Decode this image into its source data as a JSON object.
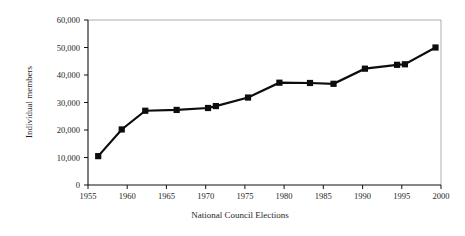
{
  "chart_data": {
    "type": "line",
    "title": "",
    "xlabel": "National Council Elections",
    "ylabel": "Individual members",
    "xlim": [
      1955,
      2000
    ],
    "ylim": [
      0,
      60000
    ],
    "grid": false,
    "legend": null,
    "marker": "square",
    "line_color": "#0d0d0d",
    "xticks": [
      "1955",
      "1960",
      "1965",
      "1970",
      "1975",
      "1980",
      "1985",
      "1990",
      "1995",
      "2000"
    ],
    "xtick_values": [
      1955,
      1960,
      1965,
      1970,
      1975,
      1980,
      1985,
      1990,
      1995,
      2000
    ],
    "yticks": [
      "0",
      "10,000",
      "20,000",
      "30,000",
      "40,000",
      "50,000",
      "60,000"
    ],
    "ytick_values": [
      0,
      10000,
      20000,
      30000,
      40000,
      50000,
      60000
    ],
    "x": [
      1956.3,
      1959.3,
      1962.3,
      1966.3,
      1970.3,
      1971.3,
      1975.4,
      1979.4,
      1983.3,
      1986.3,
      1990.3,
      1994.4,
      1995.4,
      1999.3
    ],
    "values": [
      10500,
      20200,
      27000,
      27300,
      28000,
      28700,
      31800,
      37200,
      37100,
      36800,
      42300,
      43700,
      43900,
      50000
    ],
    "series": [
      {
        "name": "Individual members",
        "x": [
          1956.3,
          1959.3,
          1962.3,
          1966.3,
          1970.3,
          1971.3,
          1975.4,
          1979.4,
          1983.3,
          1986.3,
          1990.3,
          1994.4,
          1995.4,
          1999.3
        ],
        "values": [
          10500,
          20200,
          27000,
          27300,
          28000,
          28700,
          31800,
          37200,
          37100,
          36800,
          42300,
          43700,
          43900,
          50000
        ]
      }
    ]
  },
  "figure": {
    "background": "#ffffff",
    "axis_color": "#111111",
    "frame_color": "#9a9a9a"
  }
}
